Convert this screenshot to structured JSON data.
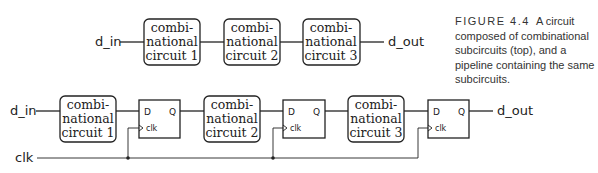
{
  "figure": {
    "number": "FIGURE 4.4",
    "caption": "A circuit composed of combinational subcircuits (top), and a pipeline containing the same subcircuits."
  },
  "top_row": {
    "input": "d_in",
    "output": "d_out",
    "boxes": [
      {
        "l1": "combi-",
        "l2": "national",
        "l3": "circuit 1"
      },
      {
        "l1": "combi-",
        "l2": "national",
        "l3": "circuit 2"
      },
      {
        "l1": "combi-",
        "l2": "national",
        "l3": "circuit 3"
      }
    ]
  },
  "bottom_row": {
    "input": "d_in",
    "output": "d_out",
    "clock": "clk",
    "boxes": [
      {
        "l1": "combi-",
        "l2": "national",
        "l3": "circuit 1"
      },
      {
        "l1": "combi-",
        "l2": "national",
        "l3": "circuit 2"
      },
      {
        "l1": "combi-",
        "l2": "national",
        "l3": "circuit 3"
      }
    ],
    "flipflops": [
      {
        "d": "D",
        "q": "Q",
        "clk": "clk"
      },
      {
        "d": "D",
        "q": "Q",
        "clk": "clk"
      },
      {
        "d": "D",
        "q": "Q",
        "clk": "clk"
      }
    ]
  }
}
